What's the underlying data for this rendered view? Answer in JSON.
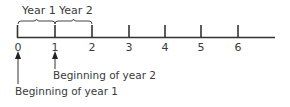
{
  "diagram": {
    "type": "timeline",
    "stroke_color": "#333333",
    "period_labels": [
      "Year 1",
      "Year 2"
    ],
    "tick_labels": [
      "0",
      "1",
      "2",
      "3",
      "4",
      "5",
      "6"
    ],
    "annotations": [
      {
        "points_to": "0",
        "text": "Beginning of year 1"
      },
      {
        "points_to": "1",
        "text": "Beginning of year 2"
      }
    ]
  }
}
